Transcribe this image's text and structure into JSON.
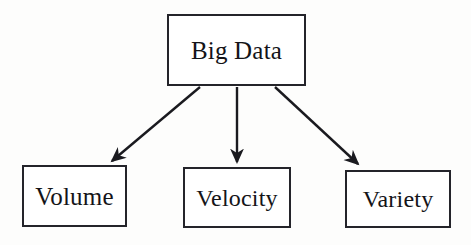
{
  "diagram": {
    "type": "tree",
    "style": {
      "background_color": "#fdfdfc",
      "box_fill_color": "#ffffff",
      "box_border_color": "#24242a",
      "text_color": "#141418",
      "arrow_color": "#1a1a1f"
    },
    "nodes": {
      "root": {
        "id": "big-data",
        "label": "Big Data"
      },
      "children": [
        {
          "id": "volume",
          "label": "Volume"
        },
        {
          "id": "velocity",
          "label": "Velocity"
        },
        {
          "id": "variety",
          "label": "Variety"
        }
      ]
    },
    "edges": [
      {
        "from": "Big Data",
        "to": "Volume",
        "marker": "arrowhead"
      },
      {
        "from": "Big Data",
        "to": "Velocity",
        "marker": "arrowhead"
      },
      {
        "from": "Big Data",
        "to": "Variety",
        "marker": "arrowhead"
      }
    ]
  }
}
